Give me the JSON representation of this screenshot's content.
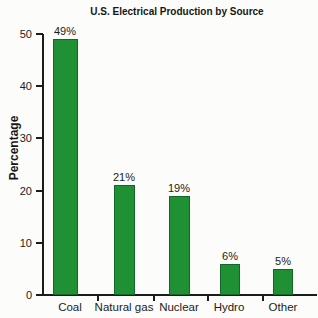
{
  "chart_data": {
    "type": "bar",
    "title": "U.S. Electrical Production by Source",
    "xlabel": "",
    "ylabel": "Percentage",
    "categories": [
      "Coal",
      "Natural gas",
      "Nuclear",
      "Hydro",
      "Other"
    ],
    "values": [
      49,
      21,
      19,
      6,
      5
    ],
    "value_labels": [
      "49%",
      "21%",
      "19%",
      "6%",
      "5%"
    ],
    "ylim": [
      0,
      50
    ],
    "yticks": [
      0,
      10,
      20,
      30,
      40,
      50
    ],
    "grid": false,
    "legend": "none",
    "bar_color": "#1f9033",
    "bar_border_color": "#14662a",
    "axis_color": "#1b1b1b",
    "background": "#fcfcfa"
  }
}
